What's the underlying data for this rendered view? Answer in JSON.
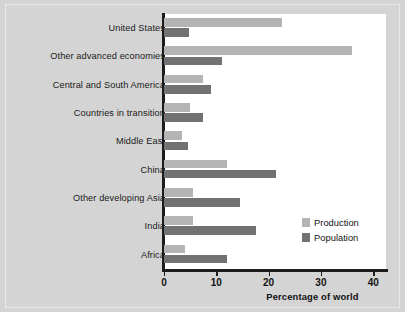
{
  "chart_data": {
    "type": "bar",
    "orientation": "horizontal",
    "title": "",
    "xlabel": "Percentage of world",
    "ylabel": "",
    "xlim": [
      0,
      43
    ],
    "xticks": [
      0,
      10,
      20,
      30,
      40
    ],
    "xtick_labels": [
      "0",
      "10",
      "20",
      "30",
      "40"
    ],
    "grid": false,
    "legend_position": "inside-right-lower",
    "categories": [
      "United States",
      "Other advanced economies",
      "Central and South America",
      "Countries in transition",
      "Middle East",
      "China",
      "Other developing Asia",
      "India",
      "Africa"
    ],
    "series": [
      {
        "name": "Production",
        "color": "#b4b4b4",
        "values": [
          22.5,
          36,
          7.5,
          5,
          3.5,
          12,
          5.5,
          5.5,
          4
        ]
      },
      {
        "name": "Population",
        "color": "#727272",
        "values": [
          4.8,
          11,
          9,
          7.5,
          4.5,
          21.5,
          14.5,
          17.5,
          12
        ]
      }
    ]
  },
  "legend": {
    "items": [
      {
        "label": "Production",
        "color": "#b4b4b4"
      },
      {
        "label": "Population",
        "color": "#727272"
      }
    ]
  }
}
